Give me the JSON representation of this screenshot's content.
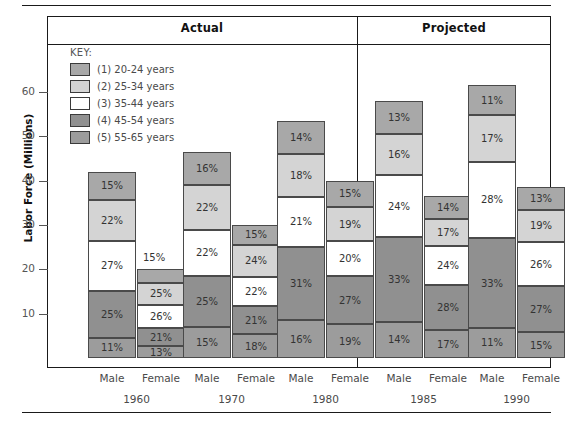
{
  "figure": {
    "y_axis_title": "Labor Force (Millions)",
    "y_ticks": [
      10,
      20,
      30,
      40,
      50,
      60
    ],
    "panels": [
      {
        "name": "actual",
        "label": "Actual"
      },
      {
        "name": "projected",
        "label": "Projected"
      }
    ],
    "key": {
      "title": "KEY:",
      "entries": [
        {
          "label": "(1) 20-24 years",
          "color": "#a8a8a8"
        },
        {
          "label": "(2) 25-34 years",
          "color": "#d4d4d4"
        },
        {
          "label": "(3) 35-44 years",
          "color": "#ffffff"
        },
        {
          "label": "(4) 45-54 years",
          "color": "#909090"
        },
        {
          "label": "(5) 55-65 years",
          "color": "#9c9c9c"
        }
      ]
    },
    "gender_labels": [
      "Male",
      "Female"
    ],
    "year_labels": [
      "1960",
      "1970",
      "1980",
      "1985",
      "1990"
    ]
  },
  "chart_data": {
    "type": "bar",
    "title": "",
    "subtitle": "",
    "xlabel": "",
    "ylabel": "Labor Force (Millions)",
    "ylim": [
      0,
      66
    ],
    "grid": false,
    "legend_position": "inside-top-left",
    "stacked": true,
    "value_unit": "percent-of-bar",
    "categories": [
      "1960 Male",
      "1960 Female",
      "1970 Male",
      "1970 Female",
      "1980 Male",
      "1980 Female",
      "1985 Male",
      "1985 Female",
      "1990 Male",
      "1990 Female"
    ],
    "bar_totals_millions": [
      42,
      20,
      46.5,
      30,
      53.5,
      40,
      58,
      36.5,
      61.5,
      38.5
    ],
    "series": [
      {
        "name": "(1) 20-24 years",
        "color": "#a8a8a8",
        "values": [
          15,
          15,
          16,
          15,
          14,
          15,
          13,
          14,
          11,
          13
        ]
      },
      {
        "name": "(2) 25-34 years",
        "color": "#d4d4d4",
        "values": [
          22,
          25,
          22,
          24,
          18,
          19,
          16,
          17,
          17,
          19
        ]
      },
      {
        "name": "(3) 35-44 years",
        "color": "#ffffff",
        "values": [
          27,
          26,
          22,
          22,
          21,
          20,
          24,
          24,
          28,
          26
        ]
      },
      {
        "name": "(4) 45-54 years",
        "color": "#909090",
        "values": [
          25,
          21,
          25,
          21,
          31,
          27,
          33,
          28,
          33,
          27
        ]
      },
      {
        "name": "(5) 55-65 years",
        "color": "#9c9c9c",
        "values": [
          11,
          13,
          15,
          18,
          16,
          19,
          14,
          17,
          11,
          15
        ]
      }
    ],
    "groups": [
      {
        "year": "1960",
        "panel": "Actual",
        "bars": [
          {
            "gender": "Male",
            "total": 42,
            "segments": [
              "15%",
              "22%",
              "27%",
              "25%",
              "11%"
            ]
          },
          {
            "gender": "Female",
            "total": 20,
            "segments": [
              "15%",
              "25%",
              "26%",
              "21%",
              "13%"
            ],
            "top_label_callout": true
          }
        ]
      },
      {
        "year": "1970",
        "panel": "Actual",
        "bars": [
          {
            "gender": "Male",
            "total": 46.5,
            "segments": [
              "16%",
              "22%",
              "22%",
              "25%",
              "15%"
            ]
          },
          {
            "gender": "Female",
            "total": 30,
            "segments": [
              "15%",
              "24%",
              "22%",
              "21%",
              "18%"
            ]
          }
        ]
      },
      {
        "year": "1980",
        "panel": "Actual",
        "bars": [
          {
            "gender": "Male",
            "total": 53.5,
            "segments": [
              "14%",
              "18%",
              "21%",
              "31%",
              "16%"
            ]
          },
          {
            "gender": "Female",
            "total": 40,
            "segments": [
              "15%",
              "19%",
              "20%",
              "27%",
              "19%"
            ]
          }
        ]
      },
      {
        "year": "1985",
        "panel": "Projected",
        "bars": [
          {
            "gender": "Male",
            "total": 58,
            "segments": [
              "13%",
              "16%",
              "24%",
              "33%",
              "14%"
            ]
          },
          {
            "gender": "Female",
            "total": 36.5,
            "segments": [
              "14%",
              "17%",
              "24%",
              "28%",
              "17%"
            ]
          }
        ]
      },
      {
        "year": "1990",
        "panel": "Projected",
        "bars": [
          {
            "gender": "Male",
            "total": 61.5,
            "segments": [
              "11%",
              "17%",
              "28%",
              "33%",
              "11%"
            ]
          },
          {
            "gender": "Female",
            "total": 38.5,
            "segments": [
              "13%",
              "19%",
              "26%",
              "27%",
              "15%"
            ]
          }
        ]
      }
    ]
  }
}
